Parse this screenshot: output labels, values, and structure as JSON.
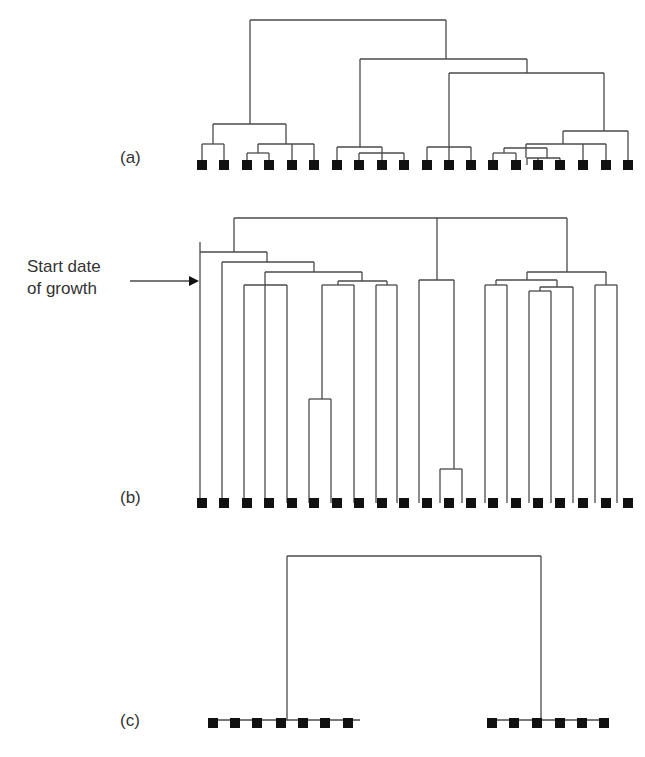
{
  "figure": {
    "panels": [
      {
        "id": "a",
        "label": "(a)"
      },
      {
        "id": "b",
        "label": "(b)"
      },
      {
        "id": "c",
        "label": "(c)"
      }
    ],
    "annotation": {
      "line1": "Start date",
      "line2": "of growth",
      "arrow": "right-arrow"
    },
    "colors": {
      "line": "#4a4a4a",
      "leaf": "#111111",
      "text": "#333333"
    },
    "leaf_x": [
      202,
      224,
      247,
      269,
      292,
      314,
      337,
      359,
      382,
      404,
      427,
      449,
      471,
      493,
      516,
      538,
      560,
      583,
      606,
      628
    ]
  },
  "chart_data": [
    {
      "type": "dendrogram",
      "title": "(a)",
      "leaf_count": 20,
      "leaf_y": 165,
      "segments": [
        [
          250,
          20,
          446,
          20
        ],
        [
          250,
          20,
          250,
          124
        ],
        [
          446,
          20,
          446,
          59
        ],
        [
          360,
          59,
          527,
          59
        ],
        [
          360,
          59,
          360,
          147
        ],
        [
          527,
          59,
          527,
          73
        ],
        [
          449,
          73,
          604,
          73
        ],
        [
          449,
          73,
          449,
          147
        ],
        [
          604,
          73,
          604,
          131
        ],
        [
          213,
          124,
          286,
          124
        ],
        [
          213,
          124,
          213,
          144
        ],
        [
          286,
          124,
          286,
          144
        ],
        [
          202,
          144,
          224,
          144
        ],
        [
          202,
          144,
          202,
          165
        ],
        [
          224,
          144,
          224,
          165
        ],
        [
          258,
          144,
          314,
          144
        ],
        [
          258,
          144,
          258,
          153
        ],
        [
          292,
          144,
          292,
          165
        ],
        [
          314,
          144,
          314,
          165
        ],
        [
          247,
          153,
          269,
          153
        ],
        [
          247,
          153,
          247,
          165
        ],
        [
          269,
          153,
          269,
          165
        ],
        [
          337,
          147,
          382,
          147
        ],
        [
          337,
          147,
          337,
          165
        ],
        [
          382,
          147,
          382,
          165
        ],
        [
          359,
          153,
          404,
          153
        ],
        [
          359,
          153,
          359,
          165
        ],
        [
          404,
          153,
          404,
          165
        ],
        [
          427,
          147,
          471,
          147
        ],
        [
          427,
          147,
          427,
          165
        ],
        [
          449,
          147,
          449,
          165
        ],
        [
          471,
          147,
          471,
          165
        ],
        [
          563,
          131,
          628,
          131
        ],
        [
          563,
          131,
          563,
          144
        ],
        [
          628,
          131,
          628,
          165
        ],
        [
          526,
          144,
          606,
          144
        ],
        [
          526,
          144,
          526,
          158
        ],
        [
          583,
          144,
          583,
          165
        ],
        [
          606,
          144,
          606,
          165
        ],
        [
          504,
          148,
          547,
          148
        ],
        [
          504,
          148,
          504,
          153
        ],
        [
          547,
          148,
          547,
          158
        ],
        [
          493,
          153,
          516,
          153
        ],
        [
          493,
          153,
          493,
          165
        ],
        [
          516,
          153,
          516,
          165
        ],
        [
          527,
          158,
          560,
          158
        ],
        [
          527,
          158,
          527,
          165
        ],
        [
          560,
          158,
          560,
          165
        ],
        [
          538,
          158,
          538,
          165
        ]
      ]
    },
    {
      "type": "dendrogram",
      "title": "(b)",
      "leaf_count": 20,
      "leaf_y": 503,
      "segments": [
        [
          234,
          218,
          567,
          218
        ],
        [
          234,
          218,
          234,
          252
        ],
        [
          567,
          218,
          567,
          272
        ],
        [
          437,
          218,
          437,
          280
        ],
        [
          200,
          252,
          267,
          252
        ],
        [
          200,
          252,
          200,
          503
        ],
        [
          267,
          252,
          267,
          262
        ],
        [
          222,
          262,
          314,
          262
        ],
        [
          222,
          262,
          222,
          503
        ],
        [
          314,
          262,
          314,
          272
        ],
        [
          265,
          272,
          362,
          272
        ],
        [
          265,
          272,
          265,
          503
        ],
        [
          362,
          272,
          362,
          281
        ],
        [
          244,
          285,
          287,
          285
        ],
        [
          244,
          285,
          244,
          503
        ],
        [
          287,
          285,
          287,
          503
        ],
        [
          338,
          281,
          387,
          281
        ],
        [
          338,
          281,
          338,
          285
        ],
        [
          387,
          281,
          387,
          285
        ],
        [
          322,
          285,
          354,
          285
        ],
        [
          322,
          285,
          322,
          399
        ],
        [
          354,
          285,
          354,
          503
        ],
        [
          376,
          285,
          397,
          285
        ],
        [
          376,
          285,
          376,
          503
        ],
        [
          397,
          285,
          397,
          503
        ],
        [
          309,
          399,
          331,
          399
        ],
        [
          309,
          399,
          309,
          503
        ],
        [
          331,
          399,
          331,
          503
        ],
        [
          419,
          280,
          454,
          280
        ],
        [
          419,
          280,
          419,
          503
        ],
        [
          454,
          280,
          454,
          469
        ],
        [
          440,
          469,
          462,
          469
        ],
        [
          440,
          469,
          440,
          503
        ],
        [
          462,
          469,
          462,
          503
        ],
        [
          527,
          272,
          606,
          272
        ],
        [
          527,
          272,
          527,
          280
        ],
        [
          606,
          272,
          606,
          285
        ],
        [
          496,
          280,
          557,
          280
        ],
        [
          496,
          280,
          496,
          285
        ],
        [
          557,
          280,
          557,
          287
        ],
        [
          485,
          285,
          507,
          285
        ],
        [
          485,
          285,
          485,
          503
        ],
        [
          507,
          285,
          507,
          503
        ],
        [
          540,
          287,
          573,
          287
        ],
        [
          540,
          287,
          540,
          291
        ],
        [
          573,
          287,
          573,
          503
        ],
        [
          529,
          291,
          551,
          291
        ],
        [
          529,
          291,
          529,
          503
        ],
        [
          551,
          291,
          551,
          503
        ],
        [
          595,
          285,
          617,
          285
        ],
        [
          595,
          285,
          595,
          503
        ],
        [
          617,
          285,
          617,
          503
        ],
        [
          200,
          242,
          200,
          252
        ]
      ]
    },
    {
      "type": "dendrogram",
      "title": "(c)",
      "leaf_count": 13,
      "leaf_y": 723,
      "segments": [
        [
          287,
          556,
          541,
          556
        ],
        [
          287,
          556,
          287,
          720
        ],
        [
          541,
          556,
          541,
          720
        ],
        [
          210,
          720,
          360,
          720
        ],
        [
          487,
          720,
          605,
          720
        ]
      ],
      "leaves_x": [
        213,
        235,
        257,
        281,
        303,
        325,
        348,
        492,
        514,
        537,
        560,
        582,
        604
      ]
    }
  ]
}
